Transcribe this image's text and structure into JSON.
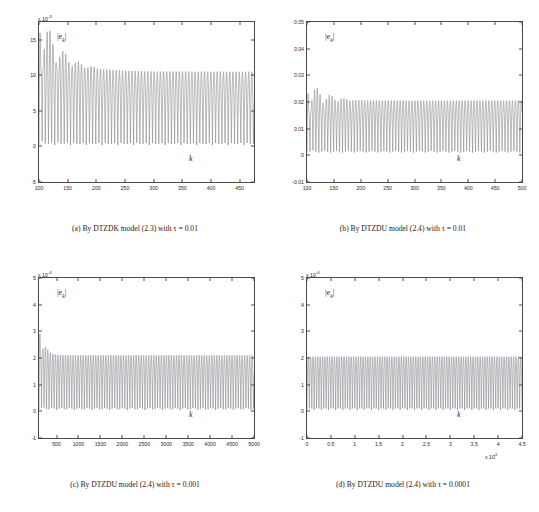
{
  "figure": {
    "header_clipped": "",
    "series_color": "#7d7d85",
    "axis_color": "#4a4a4a"
  },
  "panels": [
    {
      "id": "a",
      "caption": "(a) By DTZDK model (2.3) with τ = 0.01",
      "ylabel": "|e",
      "ylabel_sub": "k",
      "ylabel_close": "|",
      "xlabel": "k",
      "chart_data": {
        "type": "line",
        "title": "",
        "xlabel": "k",
        "ylabel": "|e_k|",
        "y_exponent": "x 10",
        "y_exponent_power": "-3",
        "x_exponent": "",
        "xlim": [
          100,
          475
        ],
        "ylim": [
          -5,
          17.5
        ],
        "xticks": [
          100,
          150,
          200,
          250,
          300,
          350,
          400,
          450
        ],
        "yticks": [
          15,
          10,
          5,
          0,
          -5
        ],
        "grid": false,
        "legend": "none",
        "description": "Oscillating absolute error |e_k| with large amplitude transient near k=100-140 peaking about 16e-3, settling to steady oscillation between 0 and about 10.5e-3",
        "envelope_peak_start": 16,
        "envelope_peak_steady": 10.5,
        "trough_steady": 0.2,
        "period": 11
      }
    },
    {
      "id": "b",
      "caption": "(b) By DTZDU model (2.4) with τ = 0.01",
      "ylabel": "|e",
      "ylabel_sub": "k",
      "ylabel_close": "|",
      "xlabel": "k",
      "chart_data": {
        "type": "line",
        "title": "",
        "xlabel": "k",
        "ylabel": "|e_k|",
        "y_exponent": "",
        "y_exponent_power": "",
        "x_exponent": "",
        "xlim": [
          100,
          500
        ],
        "ylim": [
          -0.01,
          0.05
        ],
        "xticks": [
          100,
          150,
          200,
          250,
          300,
          350,
          400,
          450,
          500
        ],
        "yticks": [
          0.05,
          0.04,
          0.03,
          0.02,
          0.01,
          0,
          -0.01
        ],
        "grid": false,
        "legend": "none",
        "description": "Steady oscillation of |e_k| between about 0.001 and 0.0205 with a small transient near k=100-140 reaching 0.023",
        "envelope_peak_start": 0.023,
        "envelope_peak_steady": 0.0205,
        "trough_steady": 0.001,
        "period": 11
      }
    },
    {
      "id": "c",
      "caption": "(c) By DTZDU model (2.4) with τ = 0.001",
      "ylabel": "|e",
      "ylabel_sub": "k",
      "ylabel_close": "|",
      "xlabel": "k",
      "chart_data": {
        "type": "line",
        "title": "",
        "xlabel": "k",
        "ylabel": "|e_k|",
        "y_exponent": "x 10",
        "y_exponent_power": "-4",
        "x_exponent": "",
        "xlim": [
          100,
          5000
        ],
        "ylim": [
          -1,
          5
        ],
        "xticks": [
          500,
          1000,
          1500,
          2000,
          2500,
          3000,
          3500,
          4000,
          4500,
          5000
        ],
        "yticks": [
          5,
          4,
          3,
          2,
          1,
          0,
          -1
        ],
        "grid": false,
        "legend": "none",
        "description": "Sharp initial spike to about 3.1e-4 near k=200 then steady oscillation between about 0.05e-4 and 2.1e-4",
        "envelope_peak_start": 3.1,
        "envelope_peak_steady": 2.1,
        "trough_steady": 0.05,
        "period": 115
      }
    },
    {
      "id": "d",
      "caption": "(d) By DTZDU model (2.4) with τ = 0.0001",
      "ylabel": "|e",
      "ylabel_sub": "k",
      "ylabel_close": "|",
      "xlabel": "k",
      "chart_data": {
        "type": "line",
        "title": "",
        "xlabel": "k",
        "ylabel": "|e_k|",
        "y_exponent": "x 10",
        "y_exponent_power": "-6",
        "x_exponent": "x 10",
        "x_exponent_power": "4",
        "xlim": [
          0,
          4.5
        ],
        "ylim": [
          -1,
          5
        ],
        "xticks": [
          0,
          0.5,
          1,
          1.5,
          2,
          2.5,
          3,
          3.5,
          4,
          4.5
        ],
        "yticks": [
          5,
          4,
          3,
          2,
          1,
          0,
          -1
        ],
        "grid": false,
        "legend": "none",
        "description": "Uniform steady oscillation of |e_k| between about 0.05e-6 and 2.05e-6 over the whole range",
        "envelope_peak_start": 2.05,
        "envelope_peak_steady": 2.05,
        "trough_steady": 0.05,
        "period": 0.1
      }
    }
  ]
}
